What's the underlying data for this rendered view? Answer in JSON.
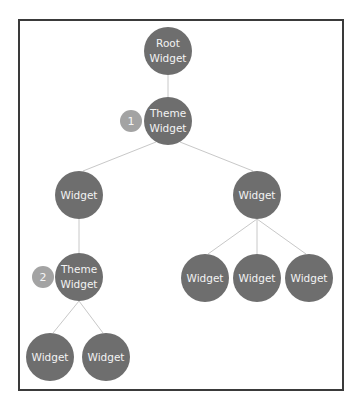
{
  "diagram": {
    "colors": {
      "node": "#6e6e6e",
      "badge": "#a3a3a3",
      "edge": "#c8c8c8",
      "frame": "#3a3a3a",
      "text": "#f3f3f3"
    },
    "nodes": [
      {
        "id": "root",
        "line1": "Root",
        "line2": "Widget",
        "cx": 168,
        "cy": 51
      },
      {
        "id": "theme1",
        "line1": "Theme",
        "line2": "Widget",
        "cx": 168,
        "cy": 121,
        "badge": "1",
        "bx": 131
      },
      {
        "id": "left",
        "line1": "Widget",
        "line2": "",
        "cx": 79,
        "cy": 195
      },
      {
        "id": "right",
        "line1": "Widget",
        "line2": "",
        "cx": 257,
        "cy": 195
      },
      {
        "id": "theme2",
        "line1": "Theme",
        "line2": "Widget",
        "cx": 79,
        "cy": 277,
        "badge": "2",
        "bx": 43
      },
      {
        "id": "r1",
        "line1": "Widget",
        "line2": "",
        "cx": 205,
        "cy": 278
      },
      {
        "id": "r2",
        "line1": "Widget",
        "line2": "",
        "cx": 257,
        "cy": 278
      },
      {
        "id": "r3",
        "line1": "Widget",
        "line2": "",
        "cx": 309,
        "cy": 278
      },
      {
        "id": "l1",
        "line1": "Widget",
        "line2": "",
        "cx": 50,
        "cy": 357
      },
      {
        "id": "l2",
        "line1": "Widget",
        "line2": "",
        "cx": 106,
        "cy": 357
      }
    ],
    "edges": [
      [
        "root",
        "theme1"
      ],
      [
        "theme1",
        "left"
      ],
      [
        "theme1",
        "right"
      ],
      [
        "left",
        "theme2"
      ],
      [
        "right",
        "r1"
      ],
      [
        "right",
        "r2"
      ],
      [
        "right",
        "r3"
      ],
      [
        "theme2",
        "l1"
      ],
      [
        "theme2",
        "l2"
      ]
    ]
  }
}
